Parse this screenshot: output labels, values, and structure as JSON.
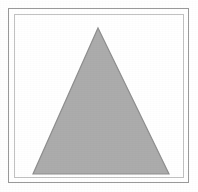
{
  "figure": {
    "title": "",
    "caption": "",
    "background_color": "#ffffff",
    "outer_frame": {
      "name": "outer-border-rectangle",
      "stroke_color": "#9a9a9a",
      "fill_color": "#ffffff",
      "stroke_width": 1,
      "x": 8,
      "y": 8,
      "width": 181,
      "height": 175
    },
    "inner_frame": {
      "name": "inner-border-rectangle",
      "stroke_color": "#c2c2c2",
      "fill_color": "#ffffff",
      "stroke_width": 1,
      "x": 14,
      "y": 14,
      "width": 170,
      "height": 164
    }
  },
  "chart_data": {
    "type": "scatter",
    "title": "",
    "subtitle": "",
    "xlabel": "",
    "ylabel": "",
    "grid": false,
    "legend": null,
    "xlim": [
      0,
      168
    ],
    "ylim": [
      0,
      162
    ],
    "tick_labels": {
      "x": [],
      "y": []
    },
    "annotations": [],
    "shapes": [
      {
        "name": "gray-triangle",
        "kind": "polygon",
        "sides": 3,
        "description": "isoceles triangle, apex at top center",
        "fill_color": "#acacac",
        "stroke_color": "#8f8f8f",
        "stroke_width": 1.2,
        "points": [
          {
            "x": 83,
            "y": 13
          },
          {
            "x": 154,
            "y": 159
          },
          {
            "x": 18,
            "y": 159
          }
        ],
        "apex": {
          "x": 83,
          "y": 13
        },
        "base_left": {
          "x": 18,
          "y": 159
        },
        "base_right": {
          "x": 154,
          "y": 159
        },
        "base_width": 136,
        "height": 146
      }
    ]
  }
}
